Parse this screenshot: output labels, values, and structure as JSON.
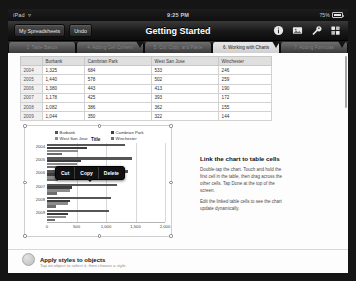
{
  "status_bar": {
    "device": "iPad",
    "wifi_icon": "wifi-icon",
    "time": "9:25 PM",
    "battery_text": "75%"
  },
  "nav": {
    "back_label": "My Spreadsheets",
    "undo_label": "Undo",
    "title": "Getting Started",
    "icons": [
      "info-icon",
      "media-insert-icon",
      "tools-wrench-icon",
      "share-icon"
    ]
  },
  "tabs": [
    {
      "label": "3. Table Basics",
      "active": false
    },
    {
      "label": "4. Adding Cell Content",
      "active": false
    },
    {
      "label": "5. Cut, Copy, and Paste",
      "active": false
    },
    {
      "label": "6. Working with Charts",
      "active": true
    },
    {
      "label": "7. Adding Formulas",
      "active": false
    }
  ],
  "table": {
    "columns": [
      "",
      "Burbank",
      "Cambrian Park",
      "West San Jose",
      "Winchester"
    ],
    "rows": [
      {
        "year": "2004",
        "values": [
          "1,325",
          "684",
          "533",
          "246"
        ]
      },
      {
        "year": "2005",
        "values": [
          "1,440",
          "578",
          "502",
          "259"
        ]
      },
      {
        "year": "2006",
        "values": [
          "1,380",
          "443",
          "413",
          "190"
        ]
      },
      {
        "year": "2007",
        "values": [
          "1,178",
          "425",
          "393",
          "172"
        ]
      },
      {
        "year": "2008",
        "values": [
          "1,082",
          "386",
          "362",
          "155"
        ]
      },
      {
        "year": "2009",
        "values": [
          "1,044",
          "350",
          "322",
          "144"
        ]
      }
    ]
  },
  "edit_popup": {
    "items": [
      "Cut",
      "Copy",
      "Delete"
    ]
  },
  "chart_data": {
    "type": "bar",
    "orientation": "horizontal",
    "title": "Title",
    "categories": [
      "2004",
      "2005",
      "2006",
      "2007",
      "2008",
      "2009"
    ],
    "series": [
      {
        "name": "Burbank",
        "color": "#555555",
        "values": [
          1325,
          1440,
          1380,
          1178,
          1082,
          1044
        ]
      },
      {
        "name": "Cambrian Park",
        "color": "#3d3d3d",
        "values": [
          684,
          578,
          443,
          425,
          386,
          350
        ]
      },
      {
        "name": "West San Jose",
        "color": "#8c8c8c",
        "values": [
          533,
          502,
          413,
          393,
          362,
          322
        ]
      },
      {
        "name": "Winchester",
        "color": "#6e6e6e",
        "values": [
          246,
          259,
          190,
          172,
          155,
          144
        ]
      }
    ],
    "xlabel": "",
    "ylabel": "",
    "xlim": [
      0,
      2000
    ],
    "xticks": [
      "0",
      "500",
      "1,000",
      "1,500",
      "2,000"
    ],
    "grid": true,
    "legend_position": "top"
  },
  "info_panel": {
    "heading": "Link the chart to table cells",
    "paragraph_1": "Double-tap the chart. Touch and hold the first cell in the table, then drag across the other cells. Tap Done at the top of the screen.",
    "paragraph_2": "Edit the linked table cells to see the chart update dynamically."
  },
  "bottom_section": {
    "title": "Apply styles to objects",
    "subtitle": "Tap an object to select it, then choose a style."
  }
}
